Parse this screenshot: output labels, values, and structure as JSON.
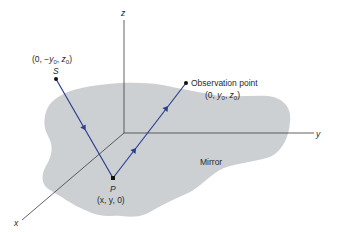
{
  "diagram": {
    "type": "geometry-optics",
    "colors": {
      "mirror_fill": "#cdd0d3",
      "ray": "#2b3f8f",
      "axis": "#3a3a3a",
      "text": "#2a2a2a"
    },
    "axes": {
      "x_label": "x",
      "y_label": "y",
      "z_label": "z"
    },
    "mirror": {
      "label": "Mirror"
    },
    "points": {
      "source": {
        "name": "S",
        "coords": "(0, −y",
        "coords_full": "(0, −y0, z0)"
      },
      "reflection": {
        "name": "P",
        "coords_full": "(x, y, 0)"
      },
      "observation": {
        "name": "Observation point",
        "coords_full": "(0, y0, z0)"
      }
    },
    "label_parts": {
      "open": "(0, ",
      "minus": "−",
      "y": "y",
      "z": "z",
      "sub0": "0",
      "comma": ", ",
      "close": ")",
      "p_coords": "(x, y, 0)"
    }
  }
}
